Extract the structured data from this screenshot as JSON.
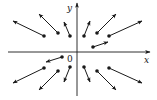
{
  "diagram": {
    "type": "vector_field",
    "axes": {
      "x_label": "x",
      "y_label": "y",
      "origin_label": "0",
      "origin_px": [
        77,
        52
      ],
      "x_axis": {
        "from": [
          8,
          52
        ],
        "to": [
          150,
          52
        ]
      },
      "y_axis": {
        "from": [
          77,
          96
        ],
        "to": [
          77,
          3
        ]
      }
    },
    "colors": {
      "ink": "#1a1a1a",
      "background": "#ffffff"
    },
    "vectors": [
      {
        "tail": [
          44,
          36
        ],
        "head": [
          13,
          21
        ]
      },
      {
        "tail": [
          58,
          33
        ],
        "head": [
          39,
          14
        ]
      },
      {
        "tail": [
          70,
          36
        ],
        "head": [
          64,
          22
        ]
      },
      {
        "tail": [
          84,
          36
        ],
        "head": [
          90,
          21
        ]
      },
      {
        "tail": [
          97,
          33
        ],
        "head": [
          116,
          14
        ]
      },
      {
        "tail": [
          109,
          36
        ],
        "head": [
          142,
          21
        ]
      },
      {
        "tail": [
          93,
          47
        ],
        "head": [
          108,
          42
        ]
      },
      {
        "tail": [
          62,
          57
        ],
        "head": [
          46,
          62
        ]
      },
      {
        "tail": [
          44,
          68
        ],
        "head": [
          13,
          83
        ]
      },
      {
        "tail": [
          58,
          71
        ],
        "head": [
          39,
          90
        ]
      },
      {
        "tail": [
          70,
          67
        ],
        "head": [
          64,
          82
        ]
      },
      {
        "tail": [
          84,
          67
        ],
        "head": [
          90,
          82
        ]
      },
      {
        "tail": [
          97,
          71
        ],
        "head": [
          116,
          90
        ]
      },
      {
        "tail": [
          109,
          68
        ],
        "head": [
          142,
          83
        ]
      }
    ]
  }
}
